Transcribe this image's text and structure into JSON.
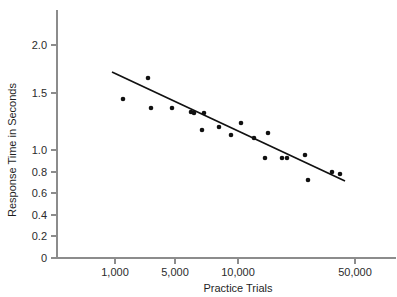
{
  "chart_data": {
    "type": "scatter",
    "title": "",
    "subtitle": "",
    "xlabel": "Practice Trials",
    "ylabel": "Response Time in Seconds",
    "x_scale": "log",
    "y_scale": "linear-broken",
    "grid": false,
    "legend": null,
    "x_ticks": [
      {
        "label": "1,000",
        "value": 1000,
        "px": 115
      },
      {
        "label": "5,000",
        "value": 5000,
        "px": 175
      },
      {
        "label": "10,000",
        "value": 10000,
        "px": 238
      },
      {
        "label": "50,000",
        "value": 50000,
        "px": 355
      }
    ],
    "y_ticks": [
      {
        "label": "2.0",
        "value": 2.0,
        "px": 45
      },
      {
        "label": "1.5",
        "value": 1.5,
        "px": 93
      },
      {
        "label": "1.0",
        "value": 1.0,
        "px": 150
      },
      {
        "label": "0.8",
        "value": 0.8,
        "px": 172
      },
      {
        "label": "0.6",
        "value": 0.6,
        "px": 193
      },
      {
        "label": "0.4",
        "value": 0.4,
        "px": 215
      },
      {
        "label": "0.2",
        "value": 0.2,
        "px": 236
      },
      {
        "label": "0",
        "value": 0,
        "px": 258
      }
    ],
    "xlim": [
      800,
      60000
    ],
    "ylim": [
      0,
      2.2
    ],
    "points": [
      {
        "x": 1300,
        "y": 1.48,
        "px": 123,
        "py": 99
      },
      {
        "x": 2900,
        "y": 1.67,
        "px": 148,
        "py": 78
      },
      {
        "x": 3100,
        "y": 1.44,
        "px": 151,
        "py": 108
      },
      {
        "x": 4700,
        "y": 1.4,
        "px": 172,
        "py": 108
      },
      {
        "x": 6100,
        "y": 1.37,
        "px": 191,
        "py": 112
      },
      {
        "x": 6300,
        "y": 1.36,
        "px": 194,
        "py": 113
      },
      {
        "x": 7300,
        "y": 1.36,
        "px": 204,
        "py": 113
      },
      {
        "x": 7000,
        "y": 1.19,
        "px": 202,
        "py": 130
      },
      {
        "x": 8500,
        "y": 1.22,
        "px": 219,
        "py": 127
      },
      {
        "x": 9800,
        "y": 1.16,
        "px": 231,
        "py": 135
      },
      {
        "x": 10200,
        "y": 1.25,
        "px": 241,
        "py": 123
      },
      {
        "x": 11600,
        "y": 1.12,
        "px": 254,
        "py": 138
      },
      {
        "x": 13000,
        "y": 1.15,
        "px": 268,
        "py": 133
      },
      {
        "x": 12600,
        "y": 0.92,
        "px": 265,
        "py": 158
      },
      {
        "x": 16000,
        "y": 0.92,
        "px": 287,
        "py": 158
      },
      {
        "x": 15200,
        "y": 0.92,
        "px": 282,
        "py": 158
      },
      {
        "x": 22000,
        "y": 0.95,
        "px": 305,
        "py": 155
      },
      {
        "x": 23000,
        "y": 0.72,
        "px": 308,
        "py": 180
      },
      {
        "x": 36000,
        "y": 0.8,
        "px": 332,
        "py": 172
      },
      {
        "x": 38000,
        "y": 0.79,
        "px": 340,
        "py": 174
      }
    ],
    "fit_line": {
      "x_start": 1000,
      "y_start": 1.72,
      "x_end": 42000,
      "y_end": 0.74,
      "px_start": 112,
      "py_start": 72,
      "px_end": 345,
      "py_end": 181
    },
    "colors": {
      "point": "#111111",
      "line": "#111111",
      "axis": "#8c8c8c",
      "text": "#1f1f1f",
      "background": "#ffffff"
    }
  }
}
